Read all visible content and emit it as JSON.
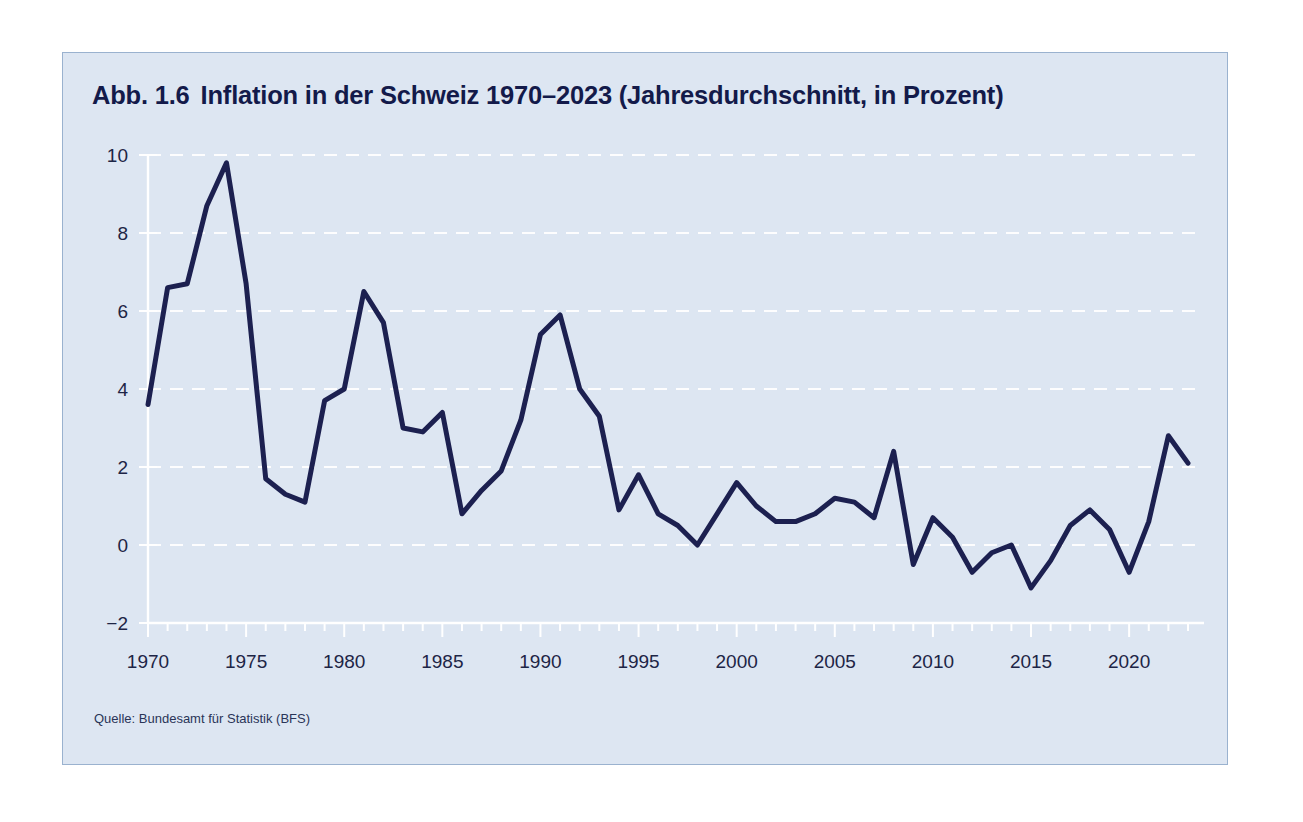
{
  "figure": {
    "number": "Abb. 1.6",
    "title": "Inflation in der Schweiz 1970–2023 (Jahresdurchschnitt, in Prozent)",
    "source": "Quelle: Bundesamt für Statistik (BFS)",
    "panel_background": "#dde6f2",
    "line_color": "#1c2050",
    "grid_color": "#ffffff",
    "text_color": "#131a4a"
  },
  "chart_data": {
    "type": "line",
    "title": "Inflation in der Schweiz 1970–2023 (Jahresdurchschnitt, in Prozent)",
    "xlabel": "",
    "ylabel": "",
    "xlim": [
      1970,
      2023
    ],
    "ylim": [
      -2,
      10
    ],
    "grid": true,
    "legend": "none",
    "y_ticks": [
      -2,
      0,
      2,
      4,
      6,
      8,
      10
    ],
    "y_tick_labels": [
      "−2",
      "0",
      "2",
      "4",
      "6",
      "8",
      "10"
    ],
    "x_ticks": [
      1970,
      1975,
      1980,
      1985,
      1990,
      1995,
      2000,
      2005,
      2010,
      2015,
      2020
    ],
    "x_tick_labels": [
      "1970",
      "1975",
      "1980",
      "1985",
      "1990",
      "1995",
      "2000",
      "2005",
      "2010",
      "2015",
      "2020"
    ],
    "x_minor_tick_step": 1,
    "series": [
      {
        "name": "Inflation (Jahresdurchschnitt, in Prozent)",
        "x": [
          1970,
          1971,
          1972,
          1973,
          1974,
          1975,
          1976,
          1977,
          1978,
          1979,
          1980,
          1981,
          1982,
          1983,
          1984,
          1985,
          1986,
          1987,
          1988,
          1989,
          1990,
          1991,
          1992,
          1993,
          1994,
          1995,
          1996,
          1997,
          1998,
          1999,
          2000,
          2001,
          2002,
          2003,
          2004,
          2005,
          2006,
          2007,
          2008,
          2009,
          2010,
          2011,
          2012,
          2013,
          2014,
          2015,
          2016,
          2017,
          2018,
          2019,
          2020,
          2021,
          2022,
          2023
        ],
        "values": [
          3.6,
          6.6,
          6.7,
          8.7,
          9.8,
          6.7,
          1.7,
          1.3,
          1.1,
          3.7,
          4.0,
          6.5,
          5.7,
          3.0,
          2.9,
          3.4,
          0.8,
          1.4,
          1.9,
          3.2,
          5.4,
          5.9,
          4.0,
          3.3,
          0.9,
          1.8,
          0.8,
          0.5,
          0.0,
          0.8,
          1.6,
          1.0,
          0.6,
          0.6,
          0.8,
          1.2,
          1.1,
          0.7,
          2.4,
          -0.5,
          0.7,
          0.2,
          -0.7,
          -0.2,
          0.0,
          -1.1,
          -0.4,
          0.5,
          0.9,
          0.4,
          -0.7,
          0.6,
          2.8,
          2.1
        ]
      }
    ]
  }
}
